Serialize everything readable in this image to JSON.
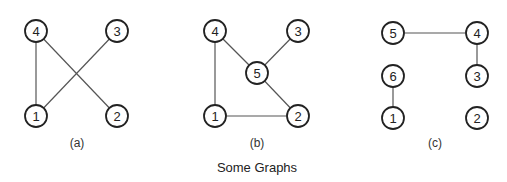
{
  "caption": "Some Graphs",
  "node_radius": 11,
  "graphs": [
    {
      "id": "a",
      "label": "(a)",
      "label_pos": [
        77,
        143
      ],
      "nodes": [
        {
          "id": "4",
          "x": 36,
          "y": 31
        },
        {
          "id": "3",
          "x": 117,
          "y": 31
        },
        {
          "id": "1",
          "x": 36,
          "y": 116
        },
        {
          "id": "2",
          "x": 117,
          "y": 116
        }
      ],
      "edges": [
        [
          "4",
          "1"
        ],
        [
          "4",
          "2"
        ],
        [
          "3",
          "1"
        ]
      ]
    },
    {
      "id": "b",
      "label": "(b)",
      "label_pos": [
        257,
        143
      ],
      "nodes": [
        {
          "id": "4",
          "x": 215,
          "y": 31
        },
        {
          "id": "3",
          "x": 298,
          "y": 31
        },
        {
          "id": "5",
          "x": 257,
          "y": 73
        },
        {
          "id": "1",
          "x": 215,
          "y": 116
        },
        {
          "id": "2",
          "x": 298,
          "y": 116
        }
      ],
      "edges": [
        [
          "4",
          "1"
        ],
        [
          "4",
          "5"
        ],
        [
          "3",
          "5"
        ],
        [
          "5",
          "2"
        ],
        [
          "1",
          "2"
        ]
      ]
    },
    {
      "id": "c",
      "label": "(c)",
      "label_pos": [
        435,
        143
      ],
      "nodes": [
        {
          "id": "5",
          "x": 393,
          "y": 33
        },
        {
          "id": "4",
          "x": 477,
          "y": 33
        },
        {
          "id": "6",
          "x": 393,
          "y": 76
        },
        {
          "id": "3",
          "x": 477,
          "y": 76
        },
        {
          "id": "1",
          "x": 393,
          "y": 118
        },
        {
          "id": "2",
          "x": 477,
          "y": 118
        }
      ],
      "edges": [
        [
          "5",
          "4"
        ],
        [
          "4",
          "3"
        ],
        [
          "6",
          "1"
        ]
      ]
    }
  ],
  "caption_pos": [
    257,
    167
  ],
  "colors": {
    "edge": "#555555",
    "node_stroke": "#222222",
    "text": "#222222"
  }
}
